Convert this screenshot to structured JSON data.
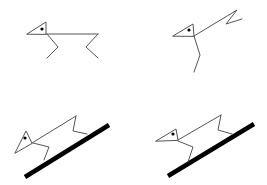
{
  "diagram": {
    "width": 267,
    "height": 185,
    "colors": {
      "line": "#555555",
      "ground": "#000000",
      "eye": "#000000",
      "background": "#ffffff"
    },
    "panels": [
      {
        "id": "top-left",
        "description": "stick figure standing, body horizontal, two legs",
        "head": "27,34 46,22 46,34",
        "eye": {
          "cx": 42,
          "cy": 29,
          "r": 1.6
        },
        "body": "46,34 98,34",
        "front_leg": "47,34 58,47 47,58",
        "back_leg": "98,34 86,47 98,58",
        "ground": null
      },
      {
        "id": "top-right",
        "description": "stick figure with body raised diagonally upward, single leg down",
        "head": "173,36 193,24 194,36",
        "eye": {
          "cx": 189,
          "cy": 30,
          "r": 1.6
        },
        "body": "194,36 237,10 226,24 242,19",
        "front_leg": "194,36 200,55 194,72",
        "back_leg": null,
        "ground": null
      },
      {
        "id": "bottom-left",
        "description": "stick figure on inclined thick ground line",
        "head": "15,153 26,131 32,143",
        "eye": {
          "cx": 25,
          "cy": 138,
          "r": 1.6
        },
        "body": "32,143 76,116",
        "front_leg": "33,143 49,147 44,160",
        "back_leg": "76,116 73,131 87,134",
        "ground": {
          "x1": 25,
          "y1": 177,
          "x2": 109,
          "y2": 125
        }
      },
      {
        "id": "bottom-right",
        "description": "stick figure on inclined thick ground line (variant)",
        "head": "156,141 176,129 178,140",
        "eye": {
          "cx": 173,
          "cy": 134,
          "r": 1.6
        },
        "body": "178,140 221,115",
        "front_leg": "178,141 193,147 188,162",
        "back_leg": "221,115 218,130 232,134",
        "ground": {
          "x1": 168,
          "y1": 176,
          "x2": 254,
          "y2": 124
        }
      }
    ]
  }
}
